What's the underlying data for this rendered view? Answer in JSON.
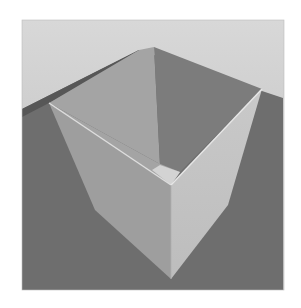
{
  "scene": {
    "description": "Rendered open box on a ground plane",
    "colors": {
      "background": "#ffffff",
      "sky_top": "#d6d6d6",
      "sky_bottom": "#bdbdbd",
      "ground": "#6e6e6e",
      "back_shadow": "#5a5a5a",
      "inner_left_wall": "#a3a3a3",
      "inner_right_wall": "#7d7d7d",
      "inner_floor": "#d2d2d2",
      "outer_left_wall": "#9d9d9d",
      "outer_right_wall": "#c6c6c6",
      "rim": "#dcdcdc"
    }
  }
}
